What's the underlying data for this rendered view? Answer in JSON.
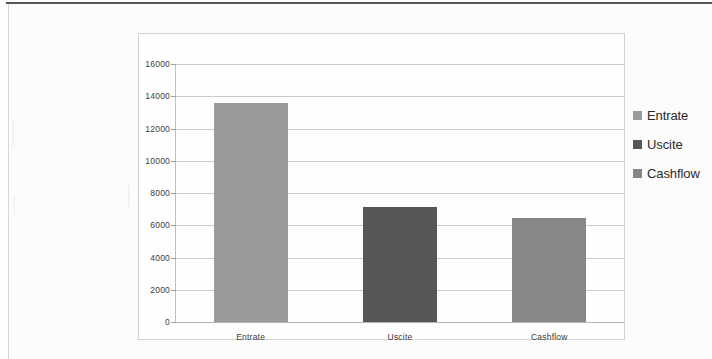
{
  "chart_data": {
    "type": "bar",
    "title": "",
    "subtitle": "",
    "xlabel": "",
    "ylabel": "",
    "categories": [
      "Entrate",
      "Uscite",
      "Cashflow"
    ],
    "values": [
      13600,
      7150,
      6450
    ],
    "series": [
      {
        "name": "Entrate",
        "values": [
          13600,
          null,
          null
        ],
        "color": "#9a9a9a"
      },
      {
        "name": "Uscite",
        "values": [
          null,
          7150,
          null
        ],
        "color": "#565656"
      },
      {
        "name": "Cashflow",
        "values": [
          null,
          null,
          6450
        ],
        "color": "#878787"
      }
    ],
    "ylim": [
      0,
      16000
    ],
    "ytick_step": 2000,
    "ytick_labels": [
      "16000",
      "14000",
      "12000",
      "10000",
      "8000",
      "6000",
      "4000",
      "2000",
      "0"
    ],
    "ytick_values": [
      16000,
      14000,
      12000,
      10000,
      8000,
      6000,
      4000,
      2000,
      0
    ],
    "grid": true,
    "grid_axis": "y",
    "legend_position": "right",
    "legend": [
      {
        "label": "Entrate",
        "color": "#9a9a9a"
      },
      {
        "label": "Uscite",
        "color": "#565656"
      },
      {
        "label": "Cashflow",
        "color": "#878787"
      }
    ]
  },
  "colors": {
    "entrate": "#9a9a9a",
    "uscite": "#565656",
    "cashflow": "#878787",
    "gridline": "#c9c9c9",
    "frame_border": "#d2d2d2",
    "page_background": "#fdfdfd",
    "axis_text": "#3c3c3c"
  }
}
